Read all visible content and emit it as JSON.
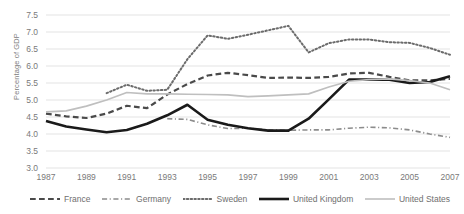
{
  "chart_data": {
    "type": "line",
    "title": "",
    "xlabel": "",
    "ylabel": "Percentage of GDP",
    "xlim": [
      1987,
      2007
    ],
    "ylim": [
      3.0,
      7.5
    ],
    "yticks": [
      "3.0",
      "3.5",
      "4.0",
      "4.5",
      "5.0",
      "5.5",
      "6.0",
      "6.5",
      "7.0",
      "7.5"
    ],
    "ytick_values": [
      3.0,
      3.5,
      4.0,
      4.5,
      5.0,
      5.5,
      6.0,
      6.5,
      7.0,
      7.5
    ],
    "xticks": [
      "1987",
      "1989",
      "1991",
      "1993",
      "1995",
      "1997",
      "1999",
      "2001",
      "2003",
      "2005",
      "2007"
    ],
    "xtick_values": [
      1987,
      1989,
      1991,
      1993,
      1995,
      1997,
      1999,
      2001,
      2003,
      2005,
      2007
    ],
    "x": [
      1987,
      1988,
      1989,
      1990,
      1991,
      1992,
      1993,
      1994,
      1995,
      1996,
      1997,
      1998,
      1999,
      2000,
      2001,
      2002,
      2003,
      2004,
      2005,
      2006,
      2007
    ],
    "grid": true,
    "legend_position": "bottom",
    "series": [
      {
        "name": "France",
        "style": "dashed",
        "color": "#4a4a4a",
        "width": 2.2,
        "x": [
          1987,
          1988,
          1989,
          1990,
          1991,
          1992,
          1993,
          1994,
          1995,
          1996,
          1997,
          1998,
          1999,
          2000,
          2001,
          2002,
          2003,
          2004,
          2005,
          2006,
          2007
        ],
        "values": [
          4.6,
          4.52,
          4.47,
          4.6,
          4.83,
          4.76,
          5.16,
          5.47,
          5.72,
          5.8,
          5.73,
          5.65,
          5.66,
          5.65,
          5.68,
          5.78,
          5.8,
          5.68,
          5.58,
          5.58,
          5.62
        ]
      },
      {
        "name": "Germany",
        "style": "dash-dot",
        "color": "#8c8c8c",
        "width": 1.6,
        "x": [
          1993,
          1994,
          1995,
          1996,
          1997,
          1998,
          1999,
          2000,
          2001,
          2002,
          2003,
          2004,
          2005,
          2006,
          2007
        ],
        "values": [
          4.45,
          4.43,
          4.27,
          4.16,
          4.17,
          4.12,
          4.11,
          4.12,
          4.12,
          4.17,
          4.2,
          4.18,
          4.12,
          4.0,
          3.9
        ]
      },
      {
        "name": "Sweden",
        "style": "dotted",
        "color": "#6b6b6b",
        "width": 2.0,
        "x": [
          1990,
          1991,
          1992,
          1993,
          1994,
          1995,
          1996,
          1997,
          1998,
          1999,
          2000,
          2001,
          2002,
          2003,
          2004,
          2005,
          2006,
          2007
        ],
        "values": [
          5.2,
          5.45,
          5.27,
          5.3,
          6.2,
          6.9,
          6.8,
          6.92,
          7.05,
          7.18,
          6.4,
          6.67,
          6.78,
          6.78,
          6.7,
          6.68,
          6.53,
          6.33
        ]
      },
      {
        "name": "United Kingdom",
        "style": "solid",
        "color": "#1a1a1a",
        "width": 2.6,
        "x": [
          1987,
          1988,
          1989,
          1990,
          1991,
          1992,
          1993,
          1994,
          1995,
          1996,
          1997,
          1998,
          1999,
          2000,
          2001,
          2002,
          2003,
          2004,
          2005,
          2006,
          2007
        ],
        "values": [
          4.38,
          4.22,
          4.13,
          4.05,
          4.12,
          4.3,
          4.55,
          4.86,
          4.42,
          4.27,
          4.17,
          4.1,
          4.1,
          4.45,
          5.02,
          5.6,
          5.6,
          5.6,
          5.5,
          5.53,
          5.7
        ]
      },
      {
        "name": "United States",
        "style": "solid",
        "color": "#bfbfbf",
        "width": 1.6,
        "x": [
          1987,
          1988,
          1989,
          1990,
          1991,
          1992,
          1993,
          1994,
          1995,
          1996,
          1997,
          1998,
          1999,
          2000,
          2001,
          2002,
          2003,
          2004,
          2005,
          2006,
          2007
        ],
        "values": [
          4.65,
          4.68,
          4.82,
          5.0,
          5.22,
          5.18,
          5.18,
          5.17,
          5.16,
          5.15,
          5.1,
          5.12,
          5.15,
          5.18,
          5.38,
          5.55,
          5.6,
          5.62,
          5.57,
          5.5,
          5.3
        ]
      }
    ]
  },
  "legend": {
    "items": [
      {
        "label": "France",
        "key": "france"
      },
      {
        "label": "Germany",
        "key": "germany"
      },
      {
        "label": "Sweden",
        "key": "sweden"
      },
      {
        "label": "United Kingdom",
        "key": "united-kingdom"
      },
      {
        "label": "United States",
        "key": "united-states"
      }
    ]
  }
}
